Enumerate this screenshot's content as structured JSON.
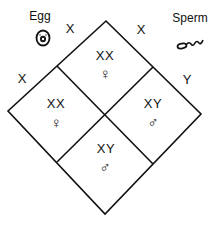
{
  "diagram": {
    "type": "punnett-square",
    "gametes": {
      "egg": {
        "label": "Egg",
        "icon": "egg-cell-icon",
        "alleles": [
          "X",
          "X"
        ]
      },
      "sperm": {
        "label": "Sperm",
        "icon": "sperm-cell-icon",
        "alleles": [
          "X",
          "Y"
        ]
      }
    },
    "allele_labels": {
      "egg_top": "X",
      "egg_left": "X",
      "sperm_top": "X",
      "sperm_right": "Y"
    },
    "cells": [
      {
        "position": "top",
        "genotype": "XX",
        "sex_symbol": "♀",
        "sex": "female"
      },
      {
        "position": "left",
        "genotype": "XX",
        "sex_symbol": "♀",
        "sex": "female"
      },
      {
        "position": "right",
        "genotype": "XY",
        "sex_symbol": "♂",
        "sex": "male"
      },
      {
        "position": "bottom",
        "genotype": "XY",
        "sex_symbol": "♂",
        "sex": "male"
      }
    ],
    "colors": {
      "line": "#111111",
      "background": "#ffffff"
    }
  }
}
